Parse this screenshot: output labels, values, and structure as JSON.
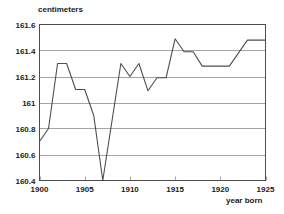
{
  "chart_data": {
    "type": "line",
    "title": "",
    "ylabel": "centimeters",
    "xlabel": "year born",
    "xlim": [
      1900,
      1925
    ],
    "ylim": [
      160.4,
      161.6
    ],
    "grid": "horizontal",
    "legend": "none",
    "x_ticks": [
      "1900",
      "1905",
      "1910",
      "1915",
      "1920",
      "1925"
    ],
    "x_tick_values": [
      1900,
      1905,
      1910,
      1915,
      1920,
      1925
    ],
    "y_ticks": [
      "160.4",
      "160.6",
      "160.8",
      "161",
      "161.2",
      "161.4",
      "161.6"
    ],
    "y_tick_values": [
      160.4,
      160.6,
      160.8,
      161,
      161.2,
      161.4,
      161.6
    ],
    "line_color": "#4d4d4d",
    "x": [
      1900,
      1901,
      1902,
      1903,
      1904,
      1905,
      1906,
      1907,
      1908,
      1909,
      1910,
      1911,
      1912,
      1913,
      1914,
      1915,
      1916,
      1917,
      1918,
      1919,
      1920,
      1921,
      1922,
      1923,
      1924,
      1925
    ],
    "values": [
      160.7,
      160.8,
      161.3,
      161.3,
      161.1,
      161.1,
      160.9,
      160.4,
      160.85,
      161.3,
      161.2,
      161.3,
      161.09,
      161.19,
      161.19,
      161.49,
      161.39,
      161.39,
      161.28,
      161.28,
      161.28,
      161.28,
      161.38,
      161.48,
      161.48,
      161.48
    ],
    "series": [
      {
        "name": "height",
        "values": [
          160.7,
          160.8,
          161.3,
          161.3,
          161.1,
          161.1,
          160.9,
          160.4,
          160.85,
          161.3,
          161.2,
          161.3,
          161.09,
          161.19,
          161.19,
          161.49,
          161.39,
          161.39,
          161.28,
          161.28,
          161.28,
          161.28,
          161.38,
          161.48,
          161.48,
          161.48
        ]
      }
    ]
  }
}
